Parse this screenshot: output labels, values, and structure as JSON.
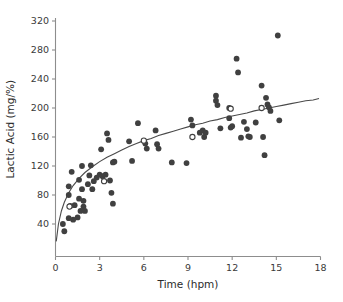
{
  "chart_data": {
    "type": "scatter",
    "title": "",
    "xlabel": "Time (hpm)",
    "ylabel": "Lactic Acid (mg/%)",
    "xlim": [
      0,
      18
    ],
    "ylim": [
      0,
      320
    ],
    "xticks": [
      0,
      3,
      6,
      9,
      12,
      15,
      18
    ],
    "yticks": [
      40,
      80,
      120,
      160,
      200,
      240,
      280,
      320
    ],
    "grid": false,
    "legend": "none",
    "series": [
      {
        "name": "filled-markers",
        "marker": "filled-circle",
        "color": "#404040",
        "points": [
          [
            0.5,
            40
          ],
          [
            0.6,
            30
          ],
          [
            0.9,
            92
          ],
          [
            0.9,
            80
          ],
          [
            0.9,
            48
          ],
          [
            1.0,
            65
          ],
          [
            1.1,
            112
          ],
          [
            1.2,
            46
          ],
          [
            1.3,
            66
          ],
          [
            1.5,
            49
          ],
          [
            1.6,
            101
          ],
          [
            1.6,
            75
          ],
          [
            1.7,
            58
          ],
          [
            1.8,
            120
          ],
          [
            1.8,
            88
          ],
          [
            1.9,
            72
          ],
          [
            1.9,
            64
          ],
          [
            2.0,
            58
          ],
          [
            2.2,
            95
          ],
          [
            2.3,
            107
          ],
          [
            2.4,
            121
          ],
          [
            2.5,
            88
          ],
          [
            2.6,
            99
          ],
          [
            2.8,
            104
          ],
          [
            3.0,
            108
          ],
          [
            3.1,
            143
          ],
          [
            3.2,
            106
          ],
          [
            3.4,
            108
          ],
          [
            3.5,
            165
          ],
          [
            3.6,
            156
          ],
          [
            3.7,
            100
          ],
          [
            3.8,
            83
          ],
          [
            3.9,
            125
          ],
          [
            3.9,
            68
          ],
          [
            4.0,
            126
          ],
          [
            5.0,
            154
          ],
          [
            5.2,
            127
          ],
          [
            5.6,
            179
          ],
          [
            6.1,
            151
          ],
          [
            6.2,
            144
          ],
          [
            6.8,
            169
          ],
          [
            6.9,
            150
          ],
          [
            7.0,
            144
          ],
          [
            7.9,
            125
          ],
          [
            8.9,
            124
          ],
          [
            9.2,
            184
          ],
          [
            9.3,
            176
          ],
          [
            9.8,
            166
          ],
          [
            10.0,
            169
          ],
          [
            10.1,
            160
          ],
          [
            10.2,
            166
          ],
          [
            10.9,
            217
          ],
          [
            10.9,
            210
          ],
          [
            11.0,
            204
          ],
          [
            11.2,
            172
          ],
          [
            11.8,
            200
          ],
          [
            11.8,
            186
          ],
          [
            11.9,
            173
          ],
          [
            12.0,
            175
          ],
          [
            12.3,
            268
          ],
          [
            12.4,
            249
          ],
          [
            12.6,
            159
          ],
          [
            12.8,
            181
          ],
          [
            13.0,
            171
          ],
          [
            13.1,
            161
          ],
          [
            13.2,
            160
          ],
          [
            13.6,
            180
          ],
          [
            14.0,
            231
          ],
          [
            14.1,
            160
          ],
          [
            14.2,
            135
          ],
          [
            14.3,
            214
          ],
          [
            14.4,
            205
          ],
          [
            14.5,
            201
          ],
          [
            14.6,
            196
          ],
          [
            15.1,
            300
          ],
          [
            15.2,
            183
          ]
        ]
      },
      {
        "name": "open-markers",
        "marker": "open-circle",
        "color": "#ffffff",
        "points": [
          [
            0.95,
            64
          ],
          [
            3.3,
            99
          ],
          [
            6.0,
            155
          ],
          [
            9.3,
            160
          ],
          [
            11.9,
            199
          ],
          [
            14.0,
            200
          ]
        ]
      }
    ],
    "fit_curve": {
      "name": "logarithmic-fit",
      "color": "#4a4a4a",
      "points": [
        [
          0.05,
          16
        ],
        [
          0.2,
          40
        ],
        [
          0.4,
          58
        ],
        [
          0.6,
          70
        ],
        [
          0.9,
          83
        ],
        [
          1.2,
          93
        ],
        [
          1.6,
          103
        ],
        [
          2.0,
          111
        ],
        [
          2.5,
          119
        ],
        [
          3.0,
          126
        ],
        [
          3.5,
          132
        ],
        [
          4.0,
          137
        ],
        [
          4.5,
          142
        ],
        [
          5.0,
          147
        ],
        [
          5.5,
          151
        ],
        [
          6.0,
          155
        ],
        [
          6.5,
          158
        ],
        [
          7.0,
          162
        ],
        [
          7.5,
          165
        ],
        [
          8.0,
          168
        ],
        [
          8.5,
          171
        ],
        [
          9.0,
          174
        ],
        [
          9.5,
          177
        ],
        [
          10.0,
          179
        ],
        [
          10.5,
          182
        ],
        [
          11.0,
          184
        ],
        [
          11.5,
          187
        ],
        [
          12.0,
          189
        ],
        [
          12.5,
          191
        ],
        [
          13.0,
          193
        ],
        [
          13.5,
          196
        ],
        [
          14.0,
          198
        ],
        [
          14.5,
          200
        ],
        [
          15.0,
          202
        ],
        [
          15.5,
          204
        ],
        [
          16.0,
          206
        ],
        [
          16.5,
          208
        ],
        [
          17.0,
          210
        ],
        [
          17.5,
          211
        ],
        [
          17.9,
          213
        ]
      ]
    }
  },
  "axes": {
    "x_tick_labels": [
      "0",
      "3",
      "6",
      "9",
      "12",
      "15",
      "18"
    ],
    "y_tick_labels": [
      "40",
      "80",
      "120",
      "160",
      "200",
      "240",
      "280",
      "320"
    ],
    "x_axis_title": "Time (hpm)",
    "y_axis_title": "Lactic Acid (mg/%)"
  }
}
